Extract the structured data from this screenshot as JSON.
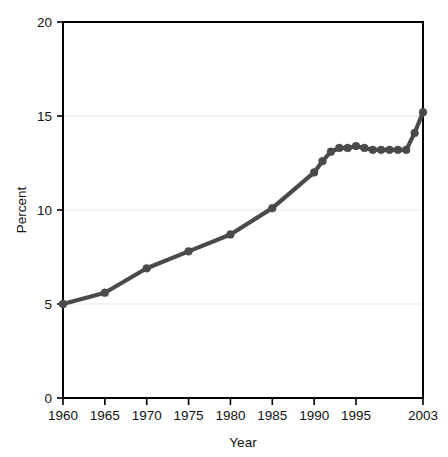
{
  "chart_data": {
    "type": "line",
    "title": "",
    "xlabel": "Year",
    "ylabel": "Percent",
    "xlim": [
      1960,
      2003
    ],
    "ylim": [
      0,
      20
    ],
    "yticks": [
      0,
      5,
      10,
      15,
      20
    ],
    "ytick_labels": [
      "0",
      "5",
      "10",
      "15",
      "20"
    ],
    "xticks": [
      1960,
      1965,
      1970,
      1975,
      1980,
      1985,
      1990,
      1995,
      2003
    ],
    "xtick_labels": [
      "1960",
      "1965",
      "1970",
      "1975",
      "1980",
      "1985",
      "1990",
      "1995",
      "2003"
    ],
    "grid": "horizontal",
    "legend": "none",
    "series": [
      {
        "name": "Percent",
        "color": "#4a4a4a",
        "marker": "circle",
        "x": [
          1960,
          1965,
          1970,
          1975,
          1980,
          1985,
          1990,
          1991,
          1992,
          1993,
          1994,
          1995,
          1996,
          1997,
          1998,
          1999,
          2000,
          2001,
          2002,
          2003
        ],
        "values": [
          5.0,
          5.6,
          6.9,
          7.8,
          8.7,
          10.1,
          12.0,
          12.6,
          13.1,
          13.3,
          13.3,
          13.4,
          13.3,
          13.2,
          13.2,
          13.2,
          13.2,
          13.2,
          14.1,
          15.2
        ]
      }
    ]
  },
  "axes": {
    "y_title": "Percent",
    "x_title": "Year"
  }
}
